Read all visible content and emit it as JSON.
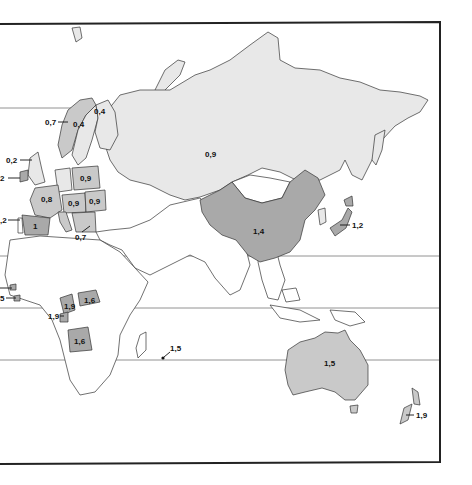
{
  "map": {
    "title": "",
    "frame": {
      "left": 0,
      "top": 23,
      "right": 440,
      "bottom": 462
    },
    "shading_colors": {
      "none": "#ffffff",
      "light": "#e8e8e8",
      "mid": "#c9c9c9",
      "dark": "#a9a9a9",
      "outline": "#333333"
    },
    "latitude_lines_y": [
      108,
      256,
      308,
      360
    ],
    "labels": [
      {
        "id": "russia",
        "text": "0,9",
        "x": 205,
        "y": 157,
        "shade": "light"
      },
      {
        "id": "china",
        "text": "1,4",
        "x": 253,
        "y": 234,
        "shade": "dark"
      },
      {
        "id": "japan",
        "text": "1,2",
        "x": 350,
        "y": 227,
        "shade": "dark",
        "arrow": true
      },
      {
        "id": "finland",
        "text": "0,4",
        "x": 94,
        "y": 114,
        "shade": "light"
      },
      {
        "id": "sweden",
        "text": "0,4",
        "x": 73,
        "y": 127,
        "shade": "light"
      },
      {
        "id": "norway",
        "text": "0,7",
        "x": 46,
        "y": 124,
        "shade": "mid",
        "arrow": true
      },
      {
        "id": "uk",
        "text": "0,2",
        "x": 8,
        "y": 162,
        "shade": "light",
        "arrow": true
      },
      {
        "id": "ireland",
        "text": "2",
        "x": 0,
        "y": 180,
        "shade": "dark",
        "arrow": true
      },
      {
        "id": "poland",
        "text": "0,9",
        "x": 80,
        "y": 180,
        "shade": "mid"
      },
      {
        "id": "france",
        "text": "0,8",
        "x": 43,
        "y": 200,
        "shade": "mid"
      },
      {
        "id": "hungary",
        "text": "0,9",
        "x": 72,
        "y": 205,
        "shade": "mid"
      },
      {
        "id": "romania",
        "text": "0,9",
        "x": 91,
        "y": 203,
        "shade": "mid"
      },
      {
        "id": "spain",
        "text": "1",
        "x": 33,
        "y": 220,
        "shade": "dark"
      },
      {
        "id": "portugal",
        "text": ",2",
        "x": 0,
        "y": 222,
        "shade": "dark",
        "arrow": true
      },
      {
        "id": "greece",
        "text": "0,7",
        "x": 75,
        "y": 237,
        "shade": "mid",
        "arrow": true
      },
      {
        "id": "senegal",
        "text": "",
        "x": 0,
        "y": 287,
        "shade": "dark",
        "arrow": true
      },
      {
        "id": "sierra-leone",
        "text": "5",
        "x": 0,
        "y": 300,
        "shade": "dark",
        "arrow": true
      },
      {
        "id": "cameroon",
        "text": "1,9",
        "x": 65,
        "y": 306,
        "shade": "dark"
      },
      {
        "id": "central-african-rep",
        "text": "1,6",
        "x": 85,
        "y": 302,
        "shade": "dark"
      },
      {
        "id": "gabon",
        "text": "1,9",
        "x": 48,
        "y": 318,
        "shade": "dark",
        "arrow": true
      },
      {
        "id": "angola",
        "text": "1,6",
        "x": 75,
        "y": 343,
        "shade": "dark"
      },
      {
        "id": "mauritius",
        "text": "1,5",
        "x": 168,
        "y": 350,
        "shade": "dark",
        "arrow": true
      },
      {
        "id": "australia",
        "text": "1,5",
        "x": 323,
        "y": 365,
        "shade": "mid"
      },
      {
        "id": "new-zealand",
        "text": "1,9",
        "x": 415,
        "y": 418,
        "shade": "mid",
        "arrow": true
      }
    ]
  }
}
